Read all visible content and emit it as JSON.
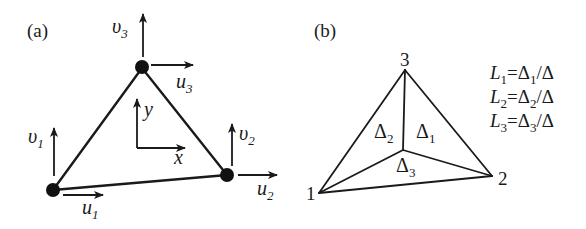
{
  "panel_a": {
    "label": "(a)",
    "nodes": [
      {
        "id": 1,
        "u_var": "u",
        "u_sub": "1",
        "v_var": "υ",
        "v_sub": "1"
      },
      {
        "id": 2,
        "u_var": "u",
        "u_sub": "2",
        "v_var": "υ",
        "v_sub": "2"
      },
      {
        "id": 3,
        "u_var": "u",
        "u_sub": "3",
        "v_var": "υ",
        "v_sub": "3"
      }
    ],
    "axes": {
      "x_label": "x",
      "y_label": "y"
    }
  },
  "panel_b": {
    "label": "(b)",
    "vertex_labels": [
      "1",
      "2",
      "3"
    ],
    "subareas": [
      {
        "symbol": "Δ",
        "sub": "1"
      },
      {
        "symbol": "Δ",
        "sub": "2"
      },
      {
        "symbol": "Δ",
        "sub": "3"
      }
    ],
    "formulas": [
      {
        "lhs": "L",
        "lhs_sub": "1",
        "eq": "=",
        "num": "Δ",
        "num_sub": "1",
        "den": "/Δ"
      },
      {
        "lhs": "L",
        "lhs_sub": "2",
        "eq": "=",
        "num": "Δ",
        "num_sub": "2",
        "den": "/Δ"
      },
      {
        "lhs": "L",
        "lhs_sub": "3",
        "eq": "=",
        "num": "Δ",
        "num_sub": "3",
        "den": "/Δ"
      }
    ]
  },
  "colors": {
    "ink": "#1a1a1a",
    "background": "#ffffff"
  }
}
